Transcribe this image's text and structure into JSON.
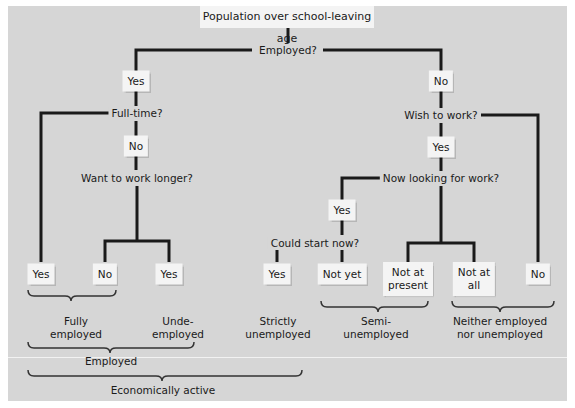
{
  "title": "Population over school-leaving age",
  "questions": {
    "employed": "Employed?",
    "full_time": "Full-time?",
    "want_longer": "Want to work longer?",
    "wish_to_work": "Wish to work?",
    "now_looking": "Now looking for work?",
    "could_start": "Could start now?"
  },
  "answers": {
    "employed_yes": "Yes",
    "employed_no": "No",
    "full_time_no": "No",
    "wish_yes": "Yes",
    "looking_yes": "Yes",
    "leaf_fulltime_yes": "Yes",
    "leaf_longer_no": "No",
    "leaf_longer_yes": "Yes",
    "leaf_start_yes": "Yes",
    "leaf_not_yet": "Not yet",
    "leaf_not_present_1": "Not at",
    "leaf_not_present_2": "present",
    "leaf_not_all_1": "Not at",
    "leaf_not_all_2": "all",
    "leaf_wish_no": "No"
  },
  "categories": {
    "fully_1": "Fully",
    "fully_2": "employed",
    "under_1": "Unde-",
    "under_2": "employed",
    "strict_1": "Strictly",
    "strict_2": "unemployed",
    "semi_1": "Semi-",
    "semi_2": "unemployed",
    "neither_1": "Neither employed",
    "neither_2": "nor unemployed",
    "employed": "Employed",
    "active": "Economically active"
  },
  "colors": {
    "panel": "#d6d6d6",
    "box": "#f4f4f4",
    "line": "#1a1a1a"
  }
}
